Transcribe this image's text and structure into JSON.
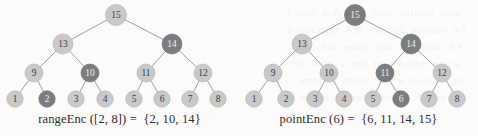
{
  "figure": {
    "background_color": "#fcfbfa",
    "edge_color": "#8d8d93",
    "node_normal_fill": "#c9c9c9",
    "node_normal_stroke": "#b0b0b0",
    "node_normal_text": "#3a3a3f",
    "node_highlight_fill": "#7d7d7f",
    "node_highlight_stroke": "#6a6a6c",
    "node_highlight_text": "#efefef",
    "caption_color": "#2b2b30",
    "scan_bleed_text": "    ansi  anoting  hast  seaf  A.A  ragn f\n  f e  nuesmn  fanclse  A.A  ragn fmn d\n   e n  aniln  As  une  nodes  tae  niln\n    e tme  minsd  fent  lop  e  lmee  so\n   nt      anosl  e  fort  nestn  ls  teme\n  e e  anoslf  e  fort  nestn  ls  temne"
  },
  "panels": [
    {
      "id": "left",
      "caption": "rangeEnc ([2, 8]) =  {2, 10, 14}",
      "operation": "rangeEnc",
      "argument": "[2, 8]",
      "result": "{2, 10, 14}",
      "highlighted_nodes": [
        2,
        10,
        14
      ],
      "nodes": [
        {
          "label": "15",
          "x": 116,
          "y": 15,
          "r": 10.5,
          "highlight": false
        },
        {
          "label": "13",
          "x": 63,
          "y": 44,
          "r": 10.0,
          "highlight": false
        },
        {
          "label": "14",
          "x": 172,
          "y": 44,
          "r": 10.0,
          "highlight": true
        },
        {
          "label": "9",
          "x": 34,
          "y": 73,
          "r": 9.0,
          "highlight": false
        },
        {
          "label": "10",
          "x": 90,
          "y": 73,
          "r": 9.0,
          "highlight": true
        },
        {
          "label": "11",
          "x": 146,
          "y": 73,
          "r": 9.0,
          "highlight": false
        },
        {
          "label": "12",
          "x": 203,
          "y": 73,
          "r": 9.0,
          "highlight": false
        },
        {
          "label": "1",
          "x": 15,
          "y": 99,
          "r": 8.2,
          "highlight": false
        },
        {
          "label": "2",
          "x": 47,
          "y": 99,
          "r": 8.2,
          "highlight": true
        },
        {
          "label": "3",
          "x": 76,
          "y": 99,
          "r": 8.2,
          "highlight": false
        },
        {
          "label": "4",
          "x": 105,
          "y": 99,
          "r": 8.2,
          "highlight": false
        },
        {
          "label": "5",
          "x": 134,
          "y": 99,
          "r": 8.2,
          "highlight": false
        },
        {
          "label": "6",
          "x": 162,
          "y": 99,
          "r": 8.2,
          "highlight": false
        },
        {
          "label": "7",
          "x": 190,
          "y": 99,
          "r": 8.2,
          "highlight": false
        },
        {
          "label": "8",
          "x": 218,
          "y": 99,
          "r": 8.2,
          "highlight": false
        }
      ],
      "edges": [
        [
          116,
          15,
          63,
          44
        ],
        [
          116,
          15,
          172,
          44
        ],
        [
          63,
          44,
          34,
          73
        ],
        [
          63,
          44,
          90,
          73
        ],
        [
          172,
          44,
          146,
          73
        ],
        [
          172,
          44,
          203,
          73
        ],
        [
          34,
          73,
          15,
          99
        ],
        [
          34,
          73,
          47,
          99
        ],
        [
          90,
          73,
          76,
          99
        ],
        [
          90,
          73,
          105,
          99
        ],
        [
          146,
          73,
          134,
          99
        ],
        [
          146,
          73,
          162,
          99
        ],
        [
          203,
          73,
          190,
          99
        ],
        [
          203,
          73,
          218,
          99
        ]
      ]
    },
    {
      "id": "right",
      "caption": "pointEnc (6) =  {6, 11, 14, 15}",
      "operation": "pointEnc",
      "argument": "6",
      "result": "{6, 11, 14, 15}",
      "highlighted_nodes": [
        6,
        11,
        14,
        15
      ],
      "nodes": [
        {
          "label": "15",
          "x": 116,
          "y": 15,
          "r": 10.5,
          "highlight": true
        },
        {
          "label": "13",
          "x": 63,
          "y": 44,
          "r": 10.0,
          "highlight": false
        },
        {
          "label": "14",
          "x": 172,
          "y": 44,
          "r": 10.0,
          "highlight": true
        },
        {
          "label": "9",
          "x": 34,
          "y": 73,
          "r": 9.0,
          "highlight": false
        },
        {
          "label": "10",
          "x": 90,
          "y": 73,
          "r": 9.0,
          "highlight": false
        },
        {
          "label": "11",
          "x": 146,
          "y": 73,
          "r": 9.0,
          "highlight": true
        },
        {
          "label": "12",
          "x": 203,
          "y": 73,
          "r": 9.0,
          "highlight": false
        },
        {
          "label": "1",
          "x": 15,
          "y": 99,
          "r": 8.2,
          "highlight": false
        },
        {
          "label": "2",
          "x": 47,
          "y": 99,
          "r": 8.2,
          "highlight": false
        },
        {
          "label": "3",
          "x": 76,
          "y": 99,
          "r": 8.2,
          "highlight": false
        },
        {
          "label": "4",
          "x": 105,
          "y": 99,
          "r": 8.2,
          "highlight": false
        },
        {
          "label": "5",
          "x": 134,
          "y": 99,
          "r": 8.2,
          "highlight": false
        },
        {
          "label": "6",
          "x": 162,
          "y": 99,
          "r": 8.2,
          "highlight": true
        },
        {
          "label": "7",
          "x": 190,
          "y": 99,
          "r": 8.2,
          "highlight": false
        },
        {
          "label": "8",
          "x": 218,
          "y": 99,
          "r": 8.2,
          "highlight": false
        }
      ],
      "edges": [
        [
          116,
          15,
          63,
          44
        ],
        [
          116,
          15,
          172,
          44
        ],
        [
          63,
          44,
          34,
          73
        ],
        [
          63,
          44,
          90,
          73
        ],
        [
          172,
          44,
          146,
          73
        ],
        [
          172,
          44,
          203,
          73
        ],
        [
          34,
          73,
          15,
          99
        ],
        [
          34,
          73,
          47,
          99
        ],
        [
          90,
          73,
          76,
          99
        ],
        [
          90,
          73,
          105,
          99
        ],
        [
          146,
          73,
          134,
          99
        ],
        [
          146,
          73,
          162,
          99
        ],
        [
          203,
          73,
          190,
          99
        ],
        [
          203,
          73,
          218,
          99
        ]
      ]
    }
  ]
}
